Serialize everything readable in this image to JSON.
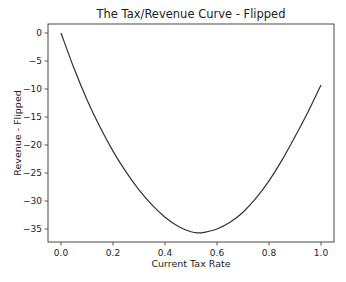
{
  "chart_data": {
    "type": "line",
    "title": "The Tax/Revenue Curve - Flipped",
    "xlabel": "Current Tax Rate",
    "ylabel": "Revenue - Flipped",
    "xlim": [
      -0.05,
      1.05
    ],
    "ylim": [
      -37.5,
      1.5
    ],
    "x_ticks": [
      0.0,
      0.2,
      0.4,
      0.6,
      0.8,
      1.0
    ],
    "x_tick_labels": [
      "0.0",
      "0.2",
      "0.4",
      "0.6",
      "0.8",
      "1.0"
    ],
    "y_ticks": [
      0,
      -5,
      -10,
      -15,
      -20,
      -25,
      -30,
      -35
    ],
    "y_tick_labels": [
      "0",
      "−5",
      "−10",
      "−15",
      "−20",
      "−25",
      "−30",
      "−35"
    ],
    "grid": false,
    "legend": null,
    "series": [
      {
        "name": "Revenue - Flipped",
        "color": "#333333",
        "x": [
          0.0,
          0.05,
          0.1,
          0.15,
          0.2,
          0.25,
          0.3,
          0.35,
          0.4,
          0.45,
          0.5,
          0.53,
          0.55,
          0.6,
          0.65,
          0.7,
          0.75,
          0.8,
          0.85,
          0.9,
          0.95,
          1.0
        ],
        "y": [
          0,
          -6.3,
          -11.9,
          -16.8,
          -21.1,
          -24.8,
          -28.0,
          -30.7,
          -32.9,
          -34.5,
          -35.5,
          -35.7,
          -35.6,
          -35.0,
          -33.8,
          -32.0,
          -29.5,
          -26.4,
          -22.7,
          -18.5,
          -14.1,
          -9.3
        ]
      }
    ]
  }
}
